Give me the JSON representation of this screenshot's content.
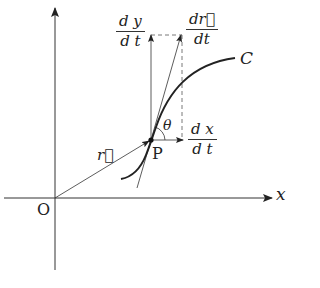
{
  "diagram": {
    "type": "vector-calculus-diagram",
    "labels": {
      "origin": "O",
      "x_axis": "x",
      "curve": "C",
      "point": "P",
      "angle": "θ",
      "position_vector": "r⃗",
      "dy_dt": {
        "num": "d y",
        "den": "d t"
      },
      "dr_dt": {
        "num": "dr⃗",
        "den": "dt"
      },
      "dx_dt": {
        "num": "d x",
        "den": "d t"
      }
    },
    "colors": {
      "line": "#333333",
      "background": "#ffffff"
    }
  }
}
